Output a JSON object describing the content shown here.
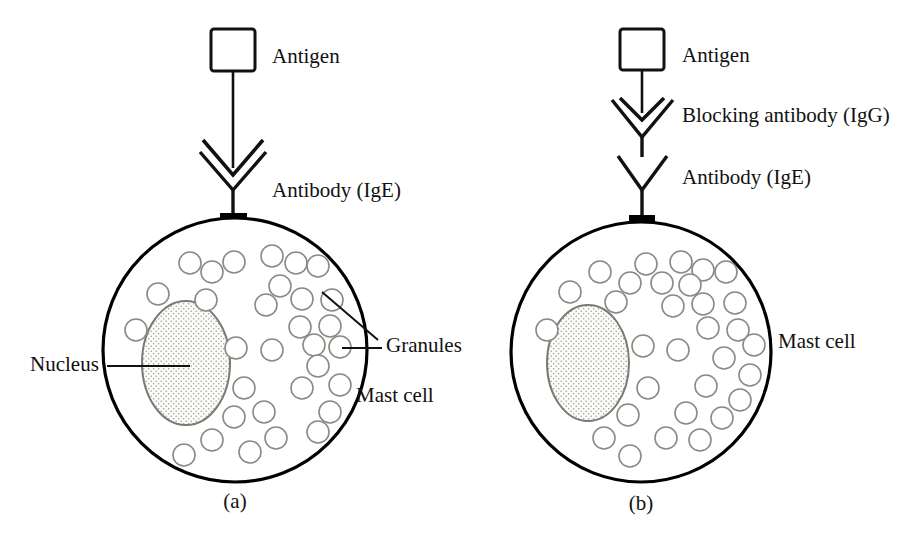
{
  "figure": {
    "background_color": "#ffffff",
    "ink_color": "#111111",
    "granule_stroke_color": "#8a8a84",
    "nucleus_stroke_color": "#7a7a72",
    "nucleus_fill_pattern": "stipple-dots"
  },
  "panels": [
    {
      "id": "a",
      "caption": "(a)",
      "labels": {
        "antigen": "Antigen",
        "antibody": "Antibody (IgE)",
        "nucleus": "Nucleus",
        "granules": "Granules",
        "mast_cell": "Mast cell"
      },
      "icons": {
        "antigen": "antigen-square-icon",
        "antibody": "antibody-y-icon",
        "arrowhead": "antigen-arrowhead-icon",
        "cell": "mast-cell-circle-icon",
        "nucleus": "nucleus-ellipse-icon",
        "granule": "granule-circle-icon",
        "anchor": "receptor-anchor-icon"
      },
      "granule_count": 31
    },
    {
      "id": "b",
      "caption": "(b)",
      "labels": {
        "antigen": "Antigen",
        "blocking_antibody": "Blocking antibody (IgG)",
        "antibody": "Antibody (IgE)",
        "mast_cell": "Mast cell"
      },
      "icons": {
        "antigen": "antigen-square-icon",
        "blocking_antibody": "blocking-antibody-y-icon",
        "antibody": "antibody-y-icon",
        "arrowhead": "antigen-arrowhead-icon",
        "cell": "mast-cell-circle-icon",
        "nucleus": "nucleus-ellipse-icon",
        "granule": "granule-circle-icon",
        "anchor": "receptor-anchor-icon"
      },
      "granule_count": 31
    }
  ]
}
